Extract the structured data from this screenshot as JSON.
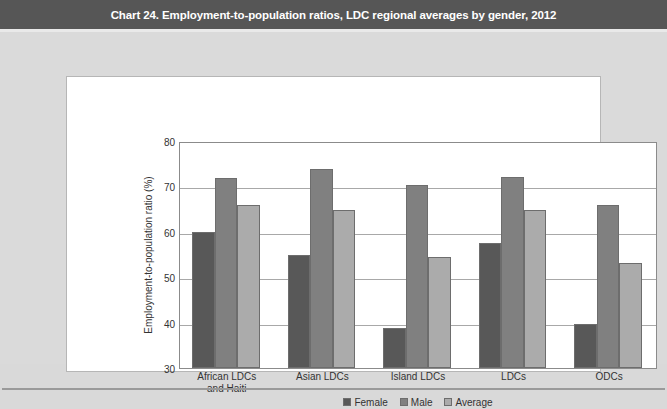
{
  "header": {
    "title": "Chart 24. Employment-to-population ratios, LDC regional averages by gender, 2012"
  },
  "colors": {
    "title_bar": "#565656",
    "page_background": "#dadada",
    "panel_background": "#ffffff",
    "female": "#585858",
    "male": "#808080",
    "average": "#ababab",
    "gridline": "#a8a8a8",
    "axis": "#8b8b8b"
  },
  "chart_data": {
    "type": "bar",
    "title": "Chart 24. Employment-to-population ratios, LDC regional averages by gender, 2012",
    "xlabel": "",
    "ylabel": "Employment-to-population ratio (%)",
    "categories": [
      "African LDCs and Haiti",
      "Asian LDCs",
      "Island LDCs",
      "LDCs",
      "ODCs"
    ],
    "category_lines": [
      [
        "African LDCs",
        "and Haiti"
      ],
      [
        "Asian LDCs"
      ],
      [
        "Island LDCs"
      ],
      [
        "LDCs"
      ],
      [
        "ODCs"
      ]
    ],
    "series": [
      {
        "name": "Female",
        "color": "#585858",
        "values": [
          60.0,
          54.8,
          38.8,
          57.6,
          39.8
        ]
      },
      {
        "name": "Male",
        "color": "#808080",
        "values": [
          71.8,
          73.8,
          70.3,
          72.0,
          66.0
        ]
      },
      {
        "name": "Average",
        "color": "#ababab",
        "values": [
          66.0,
          64.8,
          54.4,
          64.9,
          53.2
        ]
      }
    ],
    "ylim": [
      30,
      80
    ],
    "yticks": [
      30,
      40,
      50,
      60,
      70,
      80
    ],
    "ytick_labels": [
      "30",
      "40",
      "50",
      "60",
      "70",
      "80"
    ],
    "grid": true,
    "grid_axis": "y",
    "legend_position": "bottom-center",
    "legend_entries": [
      "Female",
      "Male",
      "Average"
    ]
  }
}
